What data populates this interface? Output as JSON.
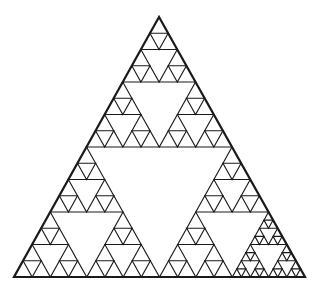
{
  "figure": {
    "type": "sierpinski-triangle",
    "background": "#ffffff",
    "stroke": "#1a1a1a",
    "outer_stroke_width": 2.2,
    "inner_stroke_width": 1.1,
    "vertices": {
      "apex": [
        159,
        17
      ],
      "bottom_left": [
        14,
        277
      ],
      "bottom_right": [
        305,
        277
      ]
    },
    "default_depth": 4,
    "deeper_region": {
      "path": [
        2,
        2
      ],
      "depth": 5
    }
  }
}
